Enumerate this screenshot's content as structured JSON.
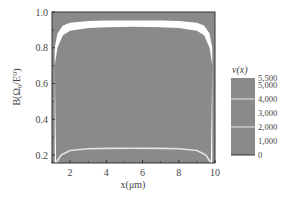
{
  "chart_data": {
    "type": "heatmap",
    "title": "",
    "xlabel": "x(μm)",
    "ylabel": "B(Ω₀/E⁰)",
    "xlim": [
      1,
      10
    ],
    "ylim": [
      0.15,
      1.0
    ],
    "x_ticks": [
      "2",
      "4",
      "6",
      "8",
      "10"
    ],
    "x_tick_values": [
      2,
      4,
      6,
      8,
      10
    ],
    "y_ticks": [
      "0.2",
      "0.4",
      "0.6",
      "0.8",
      "1.0"
    ],
    "y_tick_values": [
      0.2,
      0.4,
      0.6,
      0.8,
      1.0
    ],
    "grid": false,
    "background_color": "#8a8a8a",
    "band_color": "#ffffff",
    "series": [
      {
        "name": "upper band (high v(x))",
        "x": [
          1.15,
          1.3,
          1.6,
          2.0,
          3.0,
          4.0,
          5.5,
          7.0,
          8.0,
          9.0,
          9.4,
          9.7,
          9.85
        ],
        "y_upper": [
          0.8,
          0.88,
          0.925,
          0.94,
          0.95,
          0.952,
          0.952,
          0.952,
          0.95,
          0.94,
          0.925,
          0.88,
          0.8
        ],
        "y_lower": [
          0.7,
          0.8,
          0.87,
          0.895,
          0.91,
          0.915,
          0.917,
          0.915,
          0.91,
          0.895,
          0.87,
          0.8,
          0.7
        ]
      },
      {
        "name": "lower curve",
        "x": [
          1.25,
          1.5,
          2.0,
          3.0,
          4.0,
          5.5,
          7.0,
          8.0,
          9.0,
          9.5,
          9.75
        ],
        "y": [
          0.16,
          0.2,
          0.225,
          0.235,
          0.237,
          0.238,
          0.237,
          0.235,
          0.225,
          0.2,
          0.16
        ]
      }
    ],
    "colorbar": {
      "label": "v(x)",
      "ticks": [
        "5,500",
        "5,000",
        "4,000",
        "3,000",
        "2,000",
        "1,000",
        "0"
      ],
      "tick_values": [
        5500,
        5000,
        4000,
        3000,
        2000,
        1000,
        0
      ],
      "range": [
        0,
        5500
      ],
      "color": "#8a8a8a",
      "contour_lines_at": [
        4000,
        2000
      ]
    }
  }
}
